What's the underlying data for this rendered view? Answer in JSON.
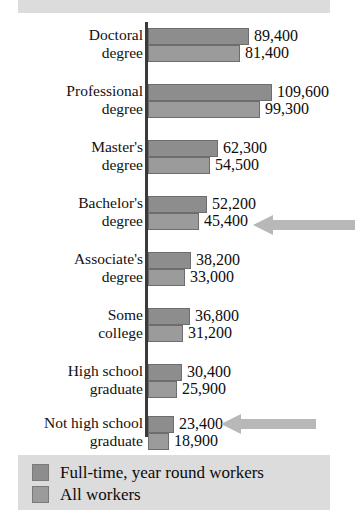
{
  "chart_data": {
    "type": "bar",
    "title": "",
    "subtitle": "",
    "xlabel": "",
    "ylabel": "",
    "orientation": "horizontal",
    "grouped": true,
    "grid": false,
    "legend_position": "bottom-left",
    "axis_range_estimate": [
      0,
      112000
    ],
    "categories": [
      "Doctoral\ndegree",
      "Professional\ndegree",
      "Master's\ndegree",
      "Bachelor's\ndegree",
      "Associate's\ndegree",
      "Some\ncollege",
      "High school\ngraduate",
      "Not high school\ngraduate"
    ],
    "series": [
      {
        "name": "Full-time, year round workers",
        "color": "#8d8d8d",
        "values": [
          89400,
          109600,
          62300,
          52200,
          38200,
          36800,
          30400,
          23400
        ],
        "labels": [
          "89,400",
          "109,600",
          "62,300",
          "52,200",
          "38,200",
          "36,800",
          "30,400",
          "23,400"
        ]
      },
      {
        "name": "All workers",
        "color": "#9b9b9b",
        "values": [
          81400,
          99300,
          54500,
          45400,
          33000,
          31200,
          25900,
          18900
        ],
        "labels": [
          "81,400",
          "99,300",
          "54,500",
          "45,400",
          "33,000",
          "31,200",
          "25,900",
          "18,900"
        ]
      }
    ],
    "annotations": [
      {
        "type": "arrow",
        "direction": "left",
        "target_category": "Bachelor's degree",
        "target_series": "All workers",
        "target_value": 45400
      },
      {
        "type": "arrow",
        "direction": "left",
        "target_category": "Not high school graduate",
        "target_series": "All workers",
        "target_value": 18900
      }
    ]
  },
  "legend": {
    "items": [
      {
        "label": "Full-time, year round workers",
        "color": "#8d8d8d"
      },
      {
        "label": "All workers",
        "color": "#9b9b9b"
      }
    ]
  },
  "colors": {
    "background": "#ffffff",
    "banner": "#dcdcdc",
    "legend_background": "#dcdcdc",
    "axis": "#3a3a3a",
    "series1": "#8d8d8d",
    "series2": "#9b9b9b",
    "arrow": "#b8b8b8",
    "text": "#0d0d0d"
  }
}
